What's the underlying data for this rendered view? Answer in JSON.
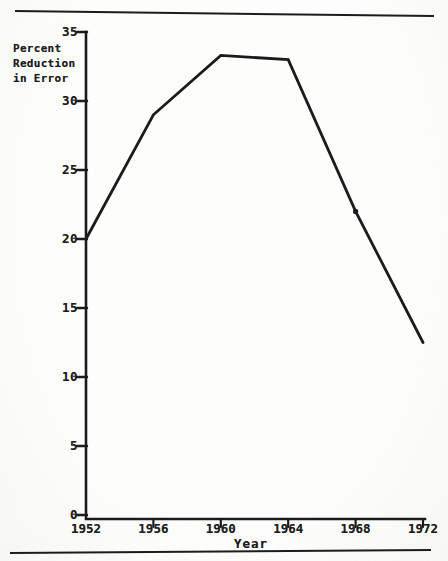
{
  "page": {
    "kind": "scanned textbook figure",
    "paper_color": "#fcfcfa",
    "ink_color": "#1b1b1b"
  },
  "chart_data": {
    "type": "line",
    "title": "",
    "xlabel": "Year",
    "ylabel": "Percent\nReduction\nin Error",
    "x": [
      1952,
      1956,
      1960,
      1964,
      1968,
      1972
    ],
    "values": [
      20,
      29,
      33.3,
      33,
      22,
      12.5
    ],
    "x_ticks": [
      1952,
      1956,
      1960,
      1964,
      1968,
      1972
    ],
    "y_ticks": [
      0,
      5,
      10,
      15,
      20,
      25,
      30,
      35
    ],
    "xlim": [
      1952,
      1972
    ],
    "ylim": [
      0,
      35
    ],
    "grid": false,
    "legend": false,
    "marker_x": [
      1968
    ],
    "line_color": "#1b1b1b"
  }
}
